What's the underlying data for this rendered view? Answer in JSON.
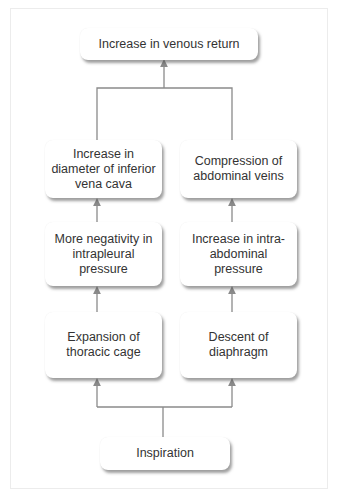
{
  "diagram": {
    "type": "flowchart",
    "direction": "bottom-to-top",
    "nodes": {
      "top": "Increase in venous return",
      "left_row1": "Increase in diameter of inferior vena cava",
      "right_row1": "Compression of abdominal veins",
      "left_row2": "More negativity in intrapleural pressure",
      "right_row2": "Increase in intra-abdominal pressure",
      "left_row3": "Expansion of thoracic cage",
      "right_row3": "Descent of diaphragm",
      "bottom": "Inspiration"
    },
    "edges": [
      [
        "bottom",
        "left_row3"
      ],
      [
        "bottom",
        "right_row3"
      ],
      [
        "left_row3",
        "left_row2"
      ],
      [
        "right_row3",
        "right_row2"
      ],
      [
        "left_row2",
        "left_row1"
      ],
      [
        "right_row2",
        "right_row1"
      ],
      [
        "left_row1",
        "top"
      ],
      [
        "right_row1",
        "top"
      ]
    ],
    "colors": {
      "line": "#8a8a8a",
      "text": "#333333",
      "box": "#ffffff",
      "frame": "#ececec"
    }
  }
}
